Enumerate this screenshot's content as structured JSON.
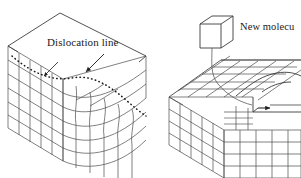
{
  "figure": {
    "background_color": "#ffffff",
    "line_color": "#3a3a3a",
    "text_color": "#1a1a1a",
    "width": 301,
    "height": 178
  },
  "labels": {
    "dislocation_line": "Dislocation line",
    "new_molecule": "New molecu",
    "new_molecule_full": "New molecule",
    "new_molecule_clipped": true
  },
  "panels": [
    {
      "name": "left-panel",
      "description": "Cubic crystal block drawn in oblique projection with a dashed dislocation line running across the top face and down the front face",
      "label": "Dislocation line",
      "features": [
        "lattice-grid",
        "dashed-dislocation-line",
        "leader-arrow",
        "lattice-distortion"
      ]
    },
    {
      "name": "right-panel",
      "description": "Cubic crystal block with a stepped ledge on the top surface and a detached unit cube above indicating an incoming new molecule",
      "label": "New molecule",
      "features": [
        "lattice-grid",
        "step-ledge",
        "detached-cube",
        "curved-leader-line",
        "step-arrow"
      ]
    }
  ],
  "annotations": {
    "dislocation_arrow": "arrow pointing from the 'Dislocation line' caption down-left to the dashed line",
    "molecule_leader": "curved line connecting the detached cube to the step on the block surface",
    "step_arrow": "small solid arrowhead marking the kink site on the ledge"
  }
}
